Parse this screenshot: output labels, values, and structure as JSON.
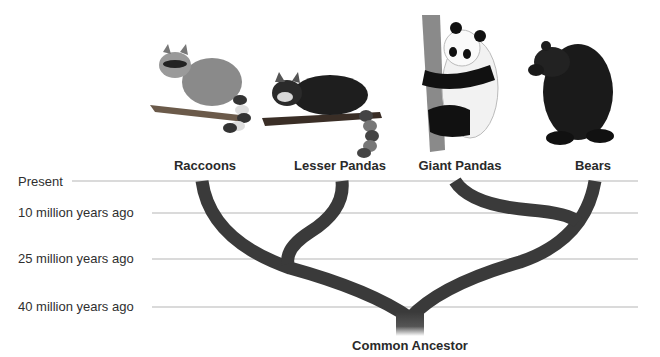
{
  "diagram": {
    "type": "phylogenetic-tree",
    "time_axis": [
      {
        "label": "Present",
        "y": 181,
        "line_start_x": 72
      },
      {
        "label": "10 million years ago",
        "y": 213,
        "line_start_x": 152
      },
      {
        "label": "25 million years ago",
        "y": 259,
        "line_start_x": 152
      },
      {
        "label": "40 million years ago",
        "y": 307,
        "line_start_x": 152
      }
    ],
    "taxa": [
      {
        "label": "Raccoons",
        "x": 205,
        "icon": "raccoon-illustration"
      },
      {
        "label": "Lesser Pandas",
        "x": 340,
        "icon": "red-panda-illustration"
      },
      {
        "label": "Giant Pandas",
        "x": 460,
        "icon": "giant-panda-illustration"
      },
      {
        "label": "Bears",
        "x": 593,
        "icon": "bear-illustration"
      }
    ],
    "root": {
      "label": "Common Ancestor"
    },
    "branch_color": "#3a3a3a",
    "line_color": "#b5b5b5"
  }
}
